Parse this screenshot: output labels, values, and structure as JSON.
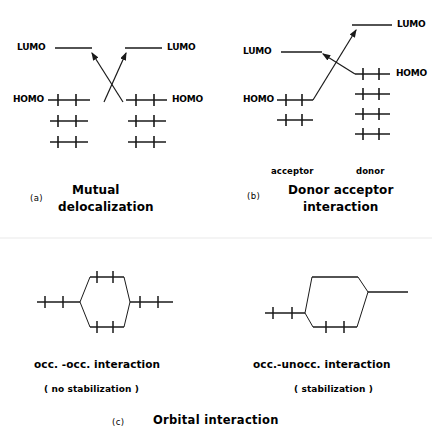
{
  "figure": {
    "title_tag": "(c)",
    "title": "Orbital  interaction",
    "panels": [
      {
        "tag": "(a)",
        "title_line1": "Mutual",
        "title_line2": "delocalization",
        "left_lumo_label": "LUMO",
        "left_homo_label": "HOMO",
        "right_lumo_label": "LUMO",
        "right_homo_label": "HOMO"
      },
      {
        "tag": "(b)",
        "title_line1": "Donor  acceptor",
        "title_line2": "interaction",
        "left_lumo_label": "LUMO",
        "left_homo_label": "HOMO",
        "right_lumo_label": "LUMO",
        "right_homo_label": "HOMO",
        "left_role_label": "acceptor",
        "right_role_label": "donor"
      }
    ],
    "interactions": [
      {
        "caption_main": "occ. -occ.  interaction",
        "caption_sub": "( no  stabilization )"
      },
      {
        "caption_main": "occ.-unocc.  interaction",
        "caption_sub": "( stabilization )"
      }
    ]
  },
  "style": {
    "stroke": "#1a1a1a",
    "background": "#ffffff"
  }
}
